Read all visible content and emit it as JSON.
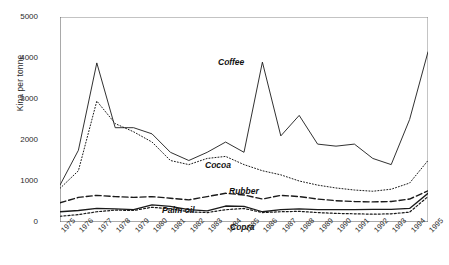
{
  "chart_data": {
    "type": "line",
    "title": "",
    "xlabel": "",
    "ylabel": "Kina per tonne",
    "ylim": [
      0,
      5000
    ],
    "yticks": [
      0,
      1000,
      2000,
      3000,
      4000,
      5000
    ],
    "grid": false,
    "legend_position": "inline-annotations",
    "x": [
      "1975",
      "1976",
      "1977",
      "1978",
      "1979",
      "1980",
      "1981",
      "1982",
      "1983",
      "1984",
      "1985",
      "1986",
      "1987",
      "1988",
      "1989",
      "1990",
      "1991",
      "1992",
      "1993",
      "1994",
      "1995"
    ],
    "series": [
      {
        "name": "Coffee",
        "style": "solid",
        "values": [
          900,
          1750,
          3880,
          2300,
          2300,
          2150,
          1700,
          1500,
          1700,
          1950,
          1700,
          3900,
          2100,
          2600,
          1900,
          1850,
          1900,
          1550,
          1400,
          2500,
          4150
        ]
      },
      {
        "name": "Cocoa",
        "style": "dotted",
        "values": [
          820,
          1250,
          2950,
          2400,
          2200,
          1950,
          1500,
          1400,
          1550,
          1600,
          1400,
          1250,
          1150,
          1000,
          900,
          830,
          780,
          750,
          800,
          950,
          1500
        ]
      },
      {
        "name": "Rubber",
        "style": "dashed",
        "values": [
          470,
          600,
          650,
          620,
          600,
          620,
          580,
          540,
          620,
          700,
          660,
          560,
          650,
          620,
          560,
          520,
          500,
          490,
          500,
          560,
          760
        ]
      },
      {
        "name": "Palm oil",
        "style": "solid-thick",
        "values": [
          250,
          280,
          330,
          320,
          300,
          420,
          380,
          300,
          270,
          390,
          380,
          250,
          300,
          320,
          300,
          300,
          300,
          310,
          310,
          330,
          700
        ]
      },
      {
        "name": "Copra",
        "style": "dotted-thick",
        "values": [
          140,
          180,
          250,
          290,
          280,
          360,
          320,
          250,
          230,
          300,
          330,
          230,
          250,
          260,
          230,
          210,
          200,
          190,
          200,
          240,
          620
        ]
      }
    ],
    "annotations": [
      {
        "text": "Coffee",
        "x_px": 218,
        "y_px": 57
      },
      {
        "text": "Cocoa",
        "x_px": 205,
        "y_px": 160
      },
      {
        "text": "Rubber",
        "x_px": 229,
        "y_px": 186
      },
      {
        "text": "Palm oil",
        "x_px": 162,
        "y_px": 205
      },
      {
        "text": "Copra",
        "x_px": 230,
        "y_px": 222
      }
    ]
  }
}
